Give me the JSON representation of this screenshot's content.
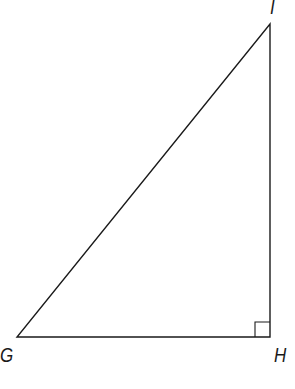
{
  "figure": {
    "type": "right-triangle",
    "stroke_color": "#1a1a1a",
    "vertices": {
      "G": {
        "label": "G",
        "x": 17,
        "y": 337
      },
      "H": {
        "label": "H",
        "x": 270,
        "y": 337
      },
      "I": {
        "label": "I",
        "x": 270,
        "y": 24
      }
    },
    "right_angle_at": "H",
    "right_angle_marker_size": 15
  }
}
